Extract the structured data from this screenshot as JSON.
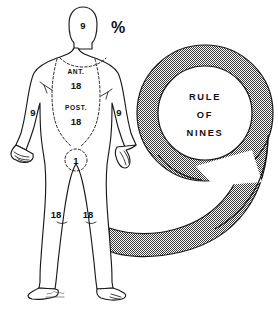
{
  "diagram": {
    "title": "Rule of Nines",
    "percent_symbol": "%",
    "body_regions": [
      {
        "id": "head",
        "label": "",
        "value": "9",
        "name": "head-percentage"
      },
      {
        "id": "anterior",
        "label": "ANT.",
        "value": "18",
        "name": "anterior-trunk-percentage"
      },
      {
        "id": "posterior",
        "label": "POST.",
        "value": "18",
        "name": "posterior-trunk-percentage"
      },
      {
        "id": "arm_left",
        "label": "",
        "value": "9",
        "name": "left-arm-percentage"
      },
      {
        "id": "arm_right",
        "label": "",
        "value": "9",
        "name": "right-arm-percentage"
      },
      {
        "id": "groin",
        "label": "",
        "value": "1",
        "name": "groin-percentage"
      },
      {
        "id": "leg_left",
        "label": "",
        "value": "18",
        "name": "left-leg-percentage"
      },
      {
        "id": "leg_right",
        "label": "",
        "value": "18",
        "name": "right-leg-percentage"
      }
    ],
    "nine_graphic": {
      "lines": [
        "RULE",
        "OF",
        "NINES"
      ],
      "fill_color": "#8c8c8c",
      "stroke_color": "#1a1a1a"
    }
  }
}
